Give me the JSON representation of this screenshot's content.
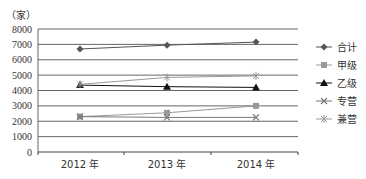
{
  "chart_data": {
    "type": "line",
    "title": "",
    "unit_label": "（家）",
    "xlabel": "",
    "ylabel": "（家）",
    "ylim": [
      0,
      8000
    ],
    "yticks": [
      0,
      1000,
      2000,
      3000,
      4000,
      5000,
      6000,
      7000,
      8000
    ],
    "grid": true,
    "legend_position": "right",
    "categories": [
      "2012 年",
      "2013 年",
      "2014 年"
    ],
    "series": [
      {
        "name": "合计",
        "marker": "diamond",
        "color": "#555555",
        "values": [
          6700,
          6950,
          7150
        ]
      },
      {
        "name": "甲级",
        "marker": "square",
        "color": "#999999",
        "values": [
          2300,
          2550,
          3000
        ]
      },
      {
        "name": "乙级",
        "marker": "triangle",
        "color": "#111111",
        "values": [
          4350,
          4250,
          4200
        ]
      },
      {
        "name": "专营",
        "marker": "x",
        "color": "#777777",
        "values": [
          2300,
          2250,
          2250
        ]
      },
      {
        "name": "兼营",
        "marker": "star",
        "color": "#999999",
        "values": [
          4400,
          4850,
          4950
        ]
      }
    ]
  }
}
